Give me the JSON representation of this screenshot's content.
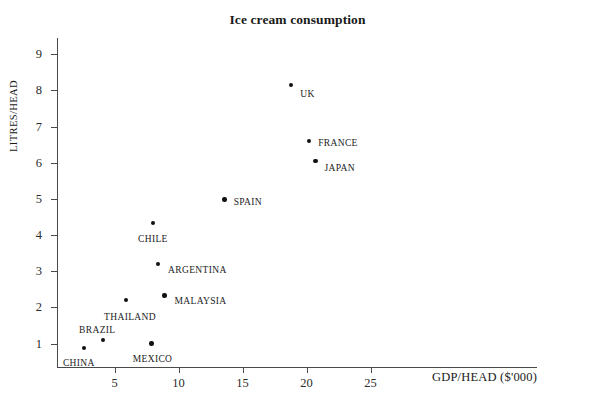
{
  "chart_data": {
    "type": "scatter",
    "title": "Ice cream consumption",
    "xlabel": "GDP/HEAD ($'000)",
    "ylabel": "LITRES/HEAD",
    "xlim": [
      0.5,
      38
    ],
    "ylim": [
      0.35,
      9.45
    ],
    "xticks": [
      5,
      10,
      15,
      20,
      25
    ],
    "yticks": [
      1,
      2,
      3,
      4,
      5,
      6,
      7,
      8,
      9
    ],
    "grid": false,
    "legend": "none",
    "points": [
      {
        "label": "UK",
        "x": 18.8,
        "y": 8.15,
        "label_dx": 9,
        "label_dy": 9
      },
      {
        "label": "FRANCE",
        "x": 20.2,
        "y": 6.6,
        "label_dx": 9,
        "label_dy": 2
      },
      {
        "label": "JAPAN",
        "x": 20.7,
        "y": 6.05,
        "label_dx": 9,
        "label_dy": 7
      },
      {
        "label": "SPAIN",
        "x": 13.6,
        "y": 4.98,
        "label_dx": 9,
        "label_dy": 2
      },
      {
        "label": "CHILE",
        "x": 8.0,
        "y": 4.33,
        "label_dx": -15,
        "label_dy": 16
      },
      {
        "label": "ARGENTINA",
        "x": 8.4,
        "y": 3.2,
        "label_dx": 10,
        "label_dy": 6
      },
      {
        "label": "MALAYSIA",
        "x": 8.9,
        "y": 2.33,
        "label_dx": 10,
        "label_dy": 6
      },
      {
        "label": "THAILAND",
        "x": 5.9,
        "y": 2.2,
        "label_dx": -22,
        "label_dy": 17
      },
      {
        "label": "BRAZIL",
        "x": 4.1,
        "y": 1.1,
        "label_dx": -24,
        "label_dy": -10
      },
      {
        "label": "MEXICO",
        "x": 7.9,
        "y": 1.0,
        "label_dx": -19,
        "label_dy": 15
      },
      {
        "label": "CHINA",
        "x": 2.6,
        "y": 0.87,
        "label_dx": -21,
        "label_dy": 15
      }
    ]
  },
  "figure": {
    "source_note": ""
  },
  "colors": {
    "marker": "#111111",
    "axis": "#4a4a4a",
    "text": "#1a1a1a",
    "background": "#ffffff"
  }
}
